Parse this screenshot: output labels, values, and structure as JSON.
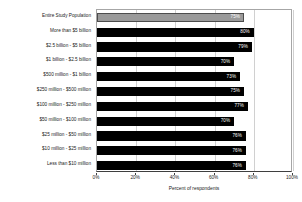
{
  "chart_data": {
    "type": "bar",
    "orientation": "horizontal",
    "title": "",
    "xlabel": "Percent of respondents",
    "ylabel": "",
    "xlim": [
      0,
      100
    ],
    "xticks": [
      "0%",
      "20%",
      "40%",
      "60%",
      "80%",
      "100%"
    ],
    "xtick_values": [
      0,
      20,
      40,
      60,
      80,
      100
    ],
    "grid": true,
    "legend": "none",
    "value_suffix": "%",
    "categories": [
      "Entire Study Population",
      "More than $5 billion",
      "$2.5 billion - $5 billion",
      "$1 billion - $2.5 billion",
      "$500 million - $1 billion",
      "$250 million - $500 million",
      "$100 million - $250 million",
      "$50 million - $100 million",
      "$25 million - $50 million",
      "$10 million - $25 million",
      "Less than $10 million"
    ],
    "values": [
      75,
      80,
      79,
      70,
      73,
      75,
      77,
      70,
      76,
      76,
      76
    ],
    "labels": [
      "75%",
      "80%",
      "79%",
      "70%",
      "73%",
      "75%",
      "77%",
      "70%",
      "76%",
      "76%",
      "76%"
    ],
    "colors": {
      "bar": "#000000",
      "highlight_bar": "#9a9a9a",
      "value_text": "#ffffff",
      "gridline": "#d0d0d0",
      "axis": "#3f3f3f",
      "text": "#1a1a1a"
    },
    "highlight_index": 0
  }
}
